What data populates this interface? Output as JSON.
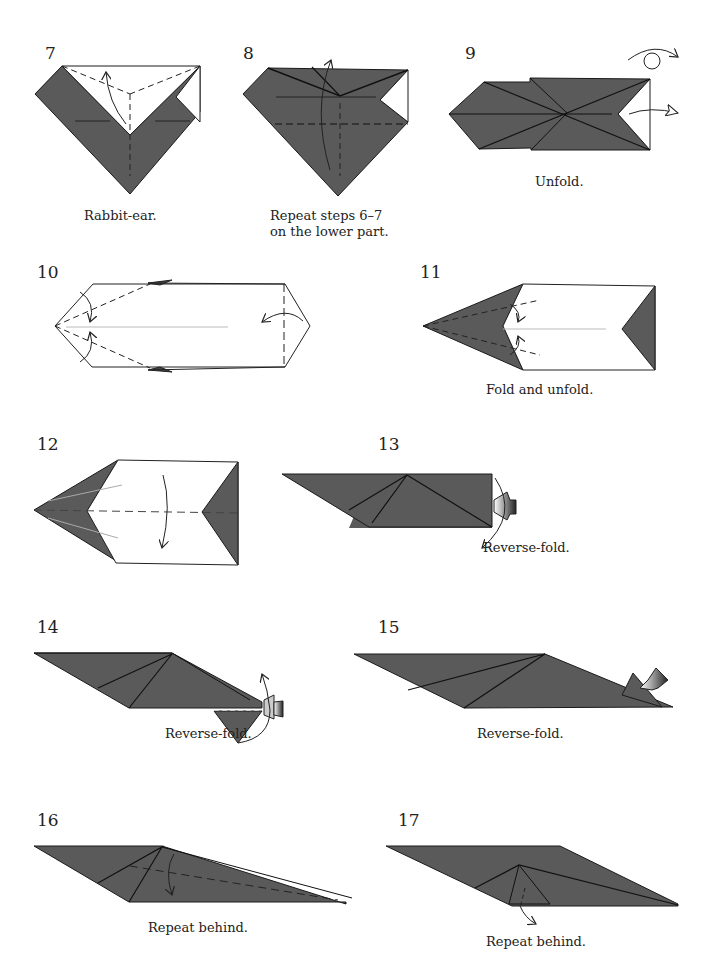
{
  "colors": {
    "paper_gray": "#5a5a5a",
    "line": "#1a1a1a",
    "white": "#ffffff"
  },
  "steps": [
    {
      "number": "7",
      "caption": "Rabbit-ear."
    },
    {
      "number": "8",
      "caption_line1": "Repeat steps 6–7",
      "caption_line2": "on the lower part."
    },
    {
      "number": "9",
      "caption": "Unfold."
    },
    {
      "number": "10",
      "caption": ""
    },
    {
      "number": "11",
      "caption": "Fold and unfold."
    },
    {
      "number": "12",
      "caption": ""
    },
    {
      "number": "13",
      "caption": "Reverse-fold."
    },
    {
      "number": "14",
      "caption": "Reverse-fold."
    },
    {
      "number": "15",
      "caption": "Reverse-fold."
    },
    {
      "number": "16",
      "caption": "Repeat behind."
    },
    {
      "number": "17",
      "caption": "Repeat behind."
    }
  ],
  "icons": {
    "turn_over": "turn-over-symbol",
    "push": "push-arrow"
  }
}
